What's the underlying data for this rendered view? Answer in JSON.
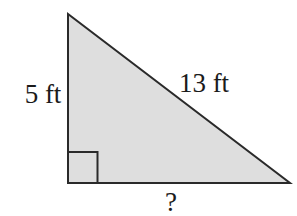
{
  "figure": {
    "type": "right-triangle",
    "labels": {
      "left_leg": "5 ft",
      "hypotenuse": "13 ft",
      "base": "?"
    },
    "values": {
      "left_leg_ft": 5,
      "hypotenuse_ft": 13,
      "base_ft": "?"
    },
    "right_angle_marker": true,
    "colors": {
      "fill": "#dedede",
      "stroke": "#2a2a2a",
      "text": "#1b1b1b",
      "background": "#ffffff"
    }
  }
}
